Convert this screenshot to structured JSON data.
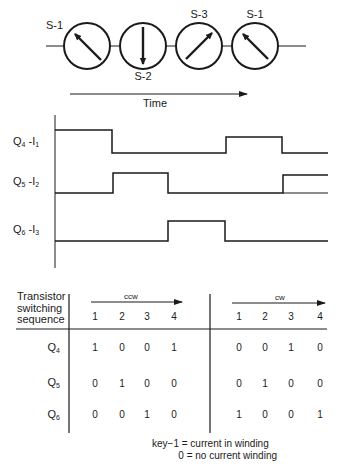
{
  "rotor_sequence": {
    "states": [
      {
        "label": "S-1",
        "arrow_direction": "upper-left",
        "label_position": "top-left"
      },
      {
        "label": "S-2",
        "arrow_direction": "down",
        "label_position": "bottom"
      },
      {
        "label": "S-3",
        "arrow_direction": "upper-right",
        "label_position": "top"
      },
      {
        "label": "S-1",
        "arrow_direction": "upper-left",
        "label_position": "top"
      }
    ],
    "time_axis_label": "Time"
  },
  "timing_diagram": {
    "signals": [
      {
        "name": "Q",
        "name_sub": "4",
        "sep": " -",
        "current": "I",
        "current_sub": "1",
        "pulses": [
          [
            55,
            112
          ],
          [
            226,
            282
          ]
        ]
      },
      {
        "name": "Q",
        "name_sub": "5",
        "sep": " -",
        "current": "I",
        "current_sub": "2",
        "pulses": [
          [
            113,
            168
          ],
          [
            283,
            328
          ]
        ]
      },
      {
        "name": "Q",
        "name_sub": "6",
        "sep": " -",
        "current": "I",
        "current_sub": "3",
        "pulses": [
          [
            168,
            225
          ]
        ]
      }
    ]
  },
  "table": {
    "header_line1": "Transistor",
    "header_line2": "switching",
    "header_line3": "sequence",
    "groups": [
      {
        "label": "ccw",
        "steps": [
          "1",
          "2",
          "3",
          "4"
        ]
      },
      {
        "label": "cw",
        "steps": [
          "1",
          "2",
          "3",
          "4"
        ]
      }
    ],
    "rows": [
      {
        "name": "Q",
        "sub": "4",
        "ccw": [
          "1",
          "0",
          "0",
          "1"
        ],
        "cw": [
          "0",
          "0",
          "1",
          "0"
        ]
      },
      {
        "name": "Q",
        "sub": "5",
        "ccw": [
          "0",
          "1",
          "0",
          "0"
        ],
        "cw": [
          "0",
          "1",
          "0",
          "0"
        ]
      },
      {
        "name": "Q",
        "sub": "6",
        "ccw": [
          "0",
          "0",
          "1",
          "0"
        ],
        "cw": [
          "1",
          "0",
          "0",
          "1"
        ]
      }
    ]
  },
  "key": {
    "line1": "key−1 = current in winding",
    "line2": "0 = no current winding"
  }
}
